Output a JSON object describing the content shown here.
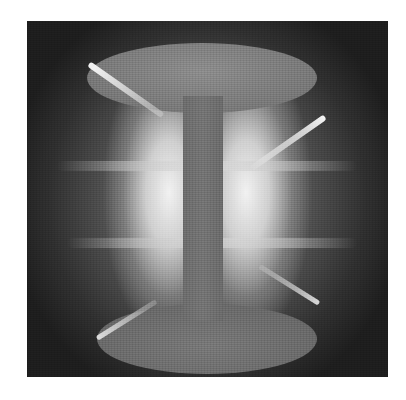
{
  "image": {
    "description": "Grayscale photograph of a glowing plasma discharge around a central column with dome-shaped top and bottom ends",
    "colors": {
      "background": "#ffffff",
      "photo_dark": "#2a2a2a",
      "glow_bright": "#f2f2f2",
      "column": "#727272"
    }
  }
}
